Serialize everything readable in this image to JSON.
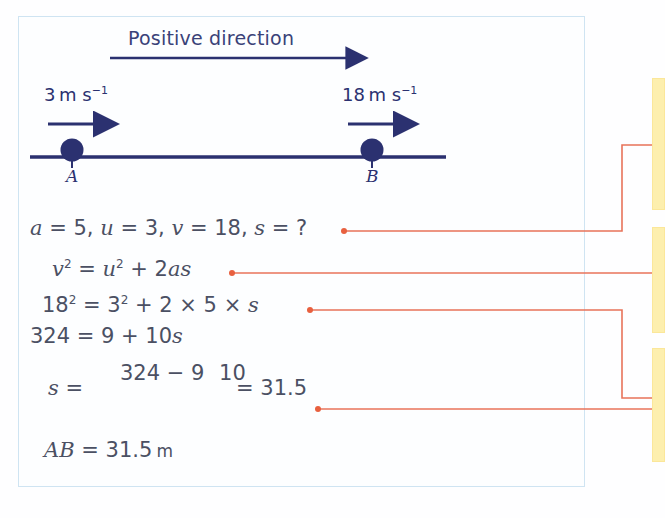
{
  "figure": {
    "title_label": "Positive direction",
    "diagram": {
      "direction_arrow": {
        "name": "positive-direction-arrow",
        "x1": 110,
        "y1": 58,
        "x2": 356,
        "y2": 58
      },
      "track_line": {
        "x1": 30,
        "y1": 157,
        "x2": 446,
        "y2": 157
      },
      "points": [
        {
          "id": "A",
          "label": "A",
          "speed_value": "3",
          "speed_unit": "m s",
          "speed_exponent": "−1",
          "cx": 72,
          "cy": 150,
          "r": 11,
          "arrow": {
            "x1": 48,
            "y1": 124,
            "x2": 104,
            "y2": 124
          }
        },
        {
          "id": "B",
          "label": "B",
          "speed_value": "18",
          "speed_unit": "m s",
          "speed_exponent": "−1",
          "cx": 372,
          "cy": 150,
          "r": 11,
          "arrow": {
            "x1": 348,
            "y1": 124,
            "x2": 404,
            "y2": 124
          }
        }
      ]
    },
    "colors": {
      "ink": "#2b3170",
      "equation_text": "#4b5063",
      "panel_border": "#cfe4f2",
      "connector": "#e8735a",
      "callout_fill": "#fdefae",
      "callout_border": "#fbe79a",
      "background": "#ffffff"
    }
  },
  "equations": {
    "given": {
      "a_var": "a",
      "a_eq": " = 5, ",
      "u_var": "u",
      "u_eq": " = 3, ",
      "v_var": "v",
      "v_eq": " = 18, ",
      "s_var": "s",
      "s_eq": " = ?"
    },
    "formula": {
      "v": "v",
      "v_pow": "2",
      "eq1": " = ",
      "u": "u",
      "u_pow": "2",
      "plus": " + 2",
      "as": "as"
    },
    "substitution": {
      "lhs": "18",
      "lhs_pow": "2",
      "eq": " = ",
      "rhs": "3",
      "rhs_pow": "2",
      "tail": " + 2 × 5 × ",
      "s": "s"
    },
    "simplified": {
      "lhs": "324 = 9 + 10",
      "s": "s"
    },
    "fraction": {
      "lead_var": "s",
      "lead_eq": " = ",
      "numerator": "324 − 9",
      "denominator": "10",
      "tail": "= 31.5"
    },
    "answer": {
      "ab": "AB",
      "eq": " = 31.5",
      "unit": "m"
    }
  },
  "connectors": [
    {
      "name": "connector-given",
      "from_eq": "given",
      "dot": {
        "cx": 344,
        "cy": 231
      },
      "path": "M 344 231 L 622 231 L 622 145 L 652 145"
    },
    {
      "name": "connector-formula",
      "from_eq": "formula",
      "dot": {
        "cx": 232,
        "cy": 273
      },
      "path": "M 232 273 L 652 273"
    },
    {
      "name": "connector-substitution",
      "from_eq": "substitution",
      "dot": {
        "cx": 310,
        "cy": 310
      },
      "path": "M 310 310 L 622 310 L 622 398 L 652 398"
    },
    {
      "name": "connector-fraction",
      "from_eq": "fraction",
      "dot": {
        "cx": 318,
        "cy": 409
      },
      "path": "M 318 409 L 652 409"
    }
  ],
  "callouts": [
    {
      "name": "callout-box-1"
    },
    {
      "name": "callout-box-2"
    },
    {
      "name": "callout-box-3"
    }
  ]
}
